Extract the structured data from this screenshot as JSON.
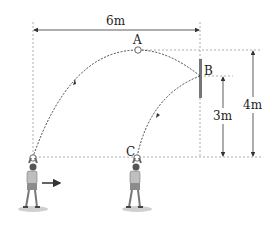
{
  "diagram": {
    "labels": {
      "width": "6m",
      "point_a": "A",
      "point_b": "B",
      "point_c": "C",
      "height_b": "3m",
      "height_a": "4m"
    },
    "colors": {
      "line": "#333333",
      "guide": "#999999",
      "wall": "#777777",
      "shirt": "#bfbfbf",
      "shorts": "#8c8c8c",
      "skin": "#e8e8e8",
      "shadow": "#cfcfcf"
    }
  }
}
